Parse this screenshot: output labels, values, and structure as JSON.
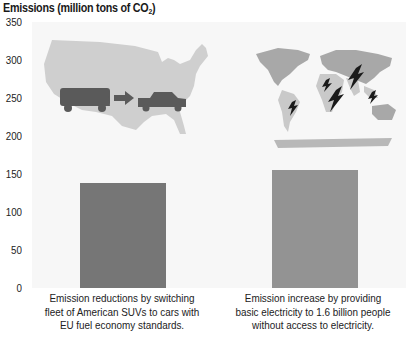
{
  "chart_data": {
    "type": "bar",
    "title": "Emissions (million tons of CO2)",
    "title_parts": {
      "main": "Emissions (million tons of CO",
      "sub": "2",
      "end": ")"
    },
    "xlabel": "",
    "ylabel": "Emissions (million tons of CO2)",
    "ylim": [
      0,
      350
    ],
    "yticks": [
      350,
      300,
      250,
      200,
      150,
      100,
      50,
      0
    ],
    "grid": false,
    "legend": "none",
    "categories": [
      "Emission reductions by switching fleet of American SUVs to cars with EU fuel economy standards.",
      "Emission increase by providing basic electricity to 1.6 billion people without access to electricity."
    ],
    "values": [
      138,
      155
    ],
    "bar_colors": [
      "#767676",
      "#939393"
    ],
    "annotations": [
      "Map of USA with SUV arrow car illustration above first bar",
      "World map with lightning bolts over developing regions above second bar"
    ]
  },
  "captions": [
    {
      "lines": [
        "Emission reductions by switching",
        "fleet of American SUVs to cars with",
        "EU fuel economy standards."
      ]
    },
    {
      "lines": [
        "Emission increase by providing",
        "basic electricity to 1.6 billion people",
        "without access to electricity."
      ]
    }
  ],
  "icons": {
    "left_illustration": "usa-map-suv-to-car-icon",
    "right_illustration": "world-map-lightning-icon"
  },
  "colors": {
    "background": "#ffffff",
    "plot_background": "#f7f7f7",
    "map_fill": "#cfcfcf",
    "map_dark": "#a8a8a8",
    "vehicle": "#5a5a5a",
    "bolt": "#1a1a1a"
  }
}
